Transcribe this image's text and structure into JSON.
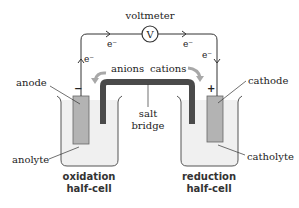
{
  "diagram": {
    "voltmeter": {
      "label": "voltmeter",
      "symbol": "V"
    },
    "electron_labels": [
      "e⁻",
      "e⁻",
      "e⁻",
      "e⁻"
    ],
    "anode": {
      "label": "anode",
      "sign": "−"
    },
    "cathode": {
      "label": "cathode",
      "sign": "+"
    },
    "ions": {
      "anions": "anions",
      "cations": "cations"
    },
    "salt_bridge": {
      "line1": "salt",
      "line2": "bridge"
    },
    "anolyte": "anolyte",
    "catholyte": "catholyte",
    "left_cell": {
      "line1": "oxidation",
      "line2": "half-cell"
    },
    "right_cell": {
      "line1": "reduction",
      "line2": "half-cell"
    },
    "colors": {
      "wire": "#333333",
      "electrode": "#b3b3b3",
      "salt_bridge": "#4a4a4a",
      "arrow": "#a8a8a8",
      "solution": "#f0f0f0",
      "beaker": "#555555",
      "text": "#222222"
    }
  }
}
